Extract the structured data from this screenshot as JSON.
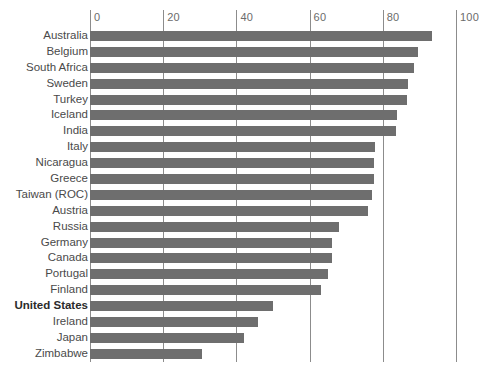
{
  "chart_data": {
    "type": "bar",
    "orientation": "horizontal",
    "title": "",
    "subtitle": "",
    "xlabel": "",
    "ylabel": "",
    "xlim": [
      0,
      100
    ],
    "grid": "vertical",
    "legend": "none",
    "bar_color": "#6e6e6e",
    "gridline_color": "#8c8c8c",
    "tick_label_color": "#6b6b6b",
    "xticks": [
      0,
      20,
      40,
      60,
      80,
      100
    ],
    "xtick_labels": [
      "0",
      "20",
      "40",
      "60",
      "80",
      "100"
    ],
    "highlight_category": "United States",
    "categories": [
      "Australia",
      "Belgium",
      "South Africa",
      "Sweden",
      "Turkey",
      "Iceland",
      "India",
      "Italy",
      "Nicaragua",
      "Greece",
      "Taiwan (ROC)",
      "Austria",
      "Russia",
      "Germany",
      "Canada",
      "Portugal",
      "Finland",
      "United States",
      "Ireland",
      "Japan",
      "Zimbabwe"
    ],
    "values": [
      93.5,
      89.5,
      88.5,
      87,
      86.5,
      84,
      83.5,
      78,
      77.5,
      77.5,
      77,
      76,
      68,
      66,
      66,
      65,
      63,
      50,
      46,
      42,
      30.5
    ],
    "bars": [
      {
        "label": "Australia",
        "value": 93.5,
        "bold": false
      },
      {
        "label": "Belgium",
        "value": 89.5,
        "bold": false
      },
      {
        "label": "South Africa",
        "value": 88.5,
        "bold": false
      },
      {
        "label": "Sweden",
        "value": 87,
        "bold": false
      },
      {
        "label": "Turkey",
        "value": 86.5,
        "bold": false
      },
      {
        "label": "Iceland",
        "value": 84,
        "bold": false
      },
      {
        "label": "India",
        "value": 83.5,
        "bold": false
      },
      {
        "label": "Italy",
        "value": 78,
        "bold": false
      },
      {
        "label": "Nicaragua",
        "value": 77.5,
        "bold": false
      },
      {
        "label": "Greece",
        "value": 77.5,
        "bold": false
      },
      {
        "label": "Taiwan (ROC)",
        "value": 77,
        "bold": false
      },
      {
        "label": "Austria",
        "value": 76,
        "bold": false
      },
      {
        "label": "Russia",
        "value": 68,
        "bold": false
      },
      {
        "label": "Germany",
        "value": 66,
        "bold": false
      },
      {
        "label": "Canada",
        "value": 66,
        "bold": false
      },
      {
        "label": "Portugal",
        "value": 65,
        "bold": false
      },
      {
        "label": "Finland",
        "value": 63,
        "bold": false
      },
      {
        "label": "United States",
        "value": 50,
        "bold": true
      },
      {
        "label": "Ireland",
        "value": 46,
        "bold": false
      },
      {
        "label": "Japan",
        "value": 42,
        "bold": false
      },
      {
        "label": "Zimbabwe",
        "value": 30.5,
        "bold": false
      }
    ]
  }
}
